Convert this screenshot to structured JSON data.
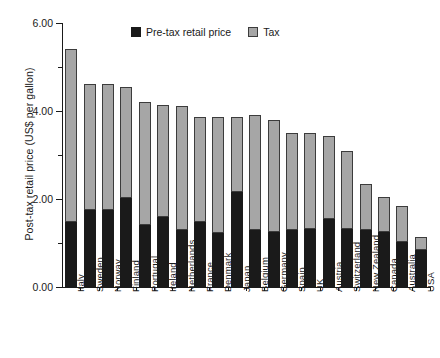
{
  "chart_data": {
    "type": "bar",
    "subtype": "stacked-vertical",
    "title": "",
    "xlabel": "",
    "ylabel": "Post-tax retail price (US$ per gallon)",
    "ylim": [
      0.0,
      6.0
    ],
    "ytick_labels": [
      "0.00",
      "2.00",
      "4.00",
      "6.00"
    ],
    "ytick_values": [
      0,
      2,
      4,
      6
    ],
    "yminor_ticks": [
      1,
      3,
      5
    ],
    "grid": false,
    "legend_position": "top-center",
    "categories": [
      "Italy",
      "Sweden",
      "Norway",
      "Finland",
      "Portugal",
      "Ireland",
      "Netherlands",
      "France",
      "Denmark",
      "Japan",
      "Belgium",
      "Germany",
      "Spain",
      "UK",
      "Austria",
      "Switzerland",
      "New Zealand",
      "Canada",
      "Australia",
      "USA"
    ],
    "series": [
      {
        "name": "Pre-tax retail price",
        "color": "#1a1a1a",
        "values": [
          1.48,
          1.75,
          1.75,
          2.02,
          1.42,
          1.6,
          1.3,
          1.48,
          1.22,
          2.16,
          1.3,
          1.25,
          1.3,
          1.32,
          1.55,
          1.32,
          1.3,
          1.25,
          1.02,
          0.84
        ]
      },
      {
        "name": "Tax",
        "color": "#a6a6a6",
        "values": [
          3.94,
          2.87,
          2.87,
          2.53,
          2.78,
          2.53,
          2.82,
          2.38,
          2.64,
          1.7,
          2.61,
          2.55,
          2.2,
          2.17,
          1.88,
          1.78,
          1.05,
          0.8,
          0.83,
          0.3
        ]
      }
    ],
    "totals": [
      5.42,
      4.62,
      4.62,
      4.55,
      4.2,
      4.13,
      4.12,
      3.86,
      3.86,
      3.86,
      3.91,
      3.8,
      3.5,
      3.49,
      3.43,
      3.1,
      2.35,
      2.05,
      1.85,
      1.14
    ]
  },
  "legend": {
    "items": [
      {
        "label": "Pre-tax retail price",
        "swatch": "black-square-swatch"
      },
      {
        "label": "Tax",
        "swatch": "gray-square-swatch"
      }
    ]
  }
}
